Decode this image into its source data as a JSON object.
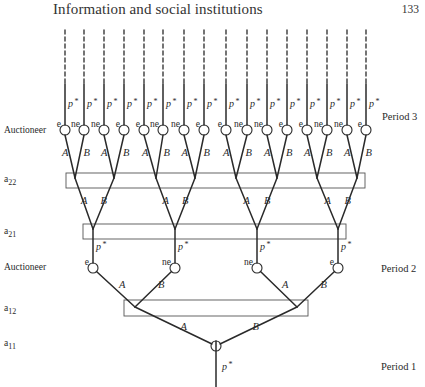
{
  "header": {
    "running_title": "Information and social institutions",
    "page_number": "133"
  },
  "margin_labels": {
    "auctioneer_top": "Auctioneer",
    "a22": {
      "base": "a",
      "sub": "22"
    },
    "a21": {
      "base": "a",
      "sub": "21"
    },
    "auctioneer_mid": "Auctioneer",
    "a12": {
      "base": "a",
      "sub": "12"
    },
    "a11": {
      "base": "a",
      "sub": "11"
    }
  },
  "period_labels": {
    "period3": "Period 3",
    "period2": "Period 2",
    "period1": "Period 1"
  },
  "symbols": {
    "price": "p",
    "star": "*",
    "branch_a": "A",
    "branch_b": "B",
    "expected": "e",
    "not_expected": "ne"
  },
  "tree": {
    "period3_lines_x": [
      65,
      84,
      104,
      124,
      144,
      163,
      184,
      204,
      226,
      247,
      267,
      287,
      307,
      327,
      347,
      366
    ],
    "period3_node_labels": [
      "e",
      "ne",
      "ne",
      "e",
      "e",
      "ne",
      "ne",
      "e",
      "e",
      "ne",
      "ne",
      "e",
      "e",
      "ne",
      "ne",
      "e"
    ],
    "period3_junctions_x": [
      75,
      114,
      156,
      195,
      236,
      277,
      317,
      357
    ],
    "period2_nodes": [
      {
        "x": 93,
        "label": "e"
      },
      {
        "x": 175,
        "label": "ne"
      },
      {
        "x": 257,
        "label": "ne"
      },
      {
        "x": 338,
        "label": "e"
      }
    ],
    "period1_junctions_x": [
      135,
      297
    ],
    "root": {
      "x": 216,
      "y": 346
    },
    "boxes": {
      "a22": {
        "x": 66,
        "y": 173,
        "w": 299,
        "h": 15
      },
      "a21": {
        "x": 83,
        "y": 224,
        "w": 263,
        "h": 15
      },
      "a12": {
        "x": 124,
        "y": 300,
        "w": 184,
        "h": 16
      }
    }
  }
}
